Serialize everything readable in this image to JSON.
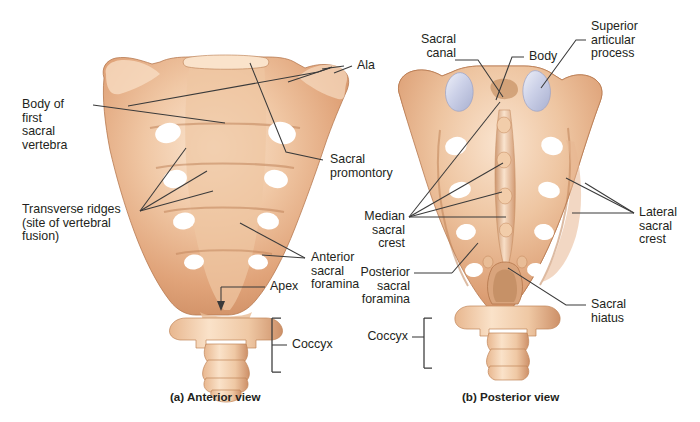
{
  "figure": {
    "bone_color": "#e3a87e",
    "bone_light": "#f6dcc4",
    "bone_shadow": "#c2825b",
    "cartilage_color": "#cdd2e6",
    "leader_color": "#3a3a3a",
    "background": "#ffffff"
  },
  "panels": [
    {
      "id": "a",
      "caption": "(a) Anterior view",
      "view": "anterior"
    },
    {
      "id": "b",
      "caption": "(b) Posterior view",
      "view": "posterior"
    }
  ],
  "labels": {
    "anterior": [
      {
        "name": "body-of-first-sacral-vertebra",
        "text": "Body of\nfirst\nsacral\nvertebra",
        "align": "left"
      },
      {
        "name": "transverse-ridges",
        "text": "Transverse ridges\n(site of vertebral\nfusion)",
        "align": "left"
      },
      {
        "name": "ala",
        "text": "Ala",
        "align": "left"
      },
      {
        "name": "sacral-promontory",
        "text": "Sacral\npromontory",
        "align": "left"
      },
      {
        "name": "anterior-sacral-foramina",
        "text": "Anterior\nsacral\nforamina",
        "align": "left"
      },
      {
        "name": "apex",
        "text": "Apex",
        "align": "left"
      },
      {
        "name": "coccyx-anterior",
        "text": "Coccyx",
        "align": "left"
      }
    ],
    "posterior": [
      {
        "name": "sacral-canal",
        "text": "Sacral\ncanal",
        "align": "left"
      },
      {
        "name": "body",
        "text": "Body",
        "align": "left"
      },
      {
        "name": "superior-articular-process",
        "text": "Superior\narticular\nprocess",
        "align": "left"
      },
      {
        "name": "median-sacral-crest",
        "text": "Median\nsacral\ncrest",
        "align": "left"
      },
      {
        "name": "lateral-sacral-crest",
        "text": "Lateral\nsacral\ncrest",
        "align": "left"
      },
      {
        "name": "posterior-sacral-foramina",
        "text": "Posterior\nsacral\nforamina",
        "align": "left"
      },
      {
        "name": "sacral-hiatus",
        "text": "Sacral\nhiatus",
        "align": "left"
      },
      {
        "name": "coccyx-posterior",
        "text": "Coccyx",
        "align": "left"
      }
    ]
  },
  "anatomy": {
    "anterior_foramina_pairs": 4,
    "posterior_foramina_pairs": 4,
    "transverse_ridges": 4,
    "coccyx_segments": 4
  }
}
